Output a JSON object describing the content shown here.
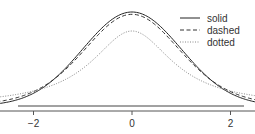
{
  "chart_data": {
    "type": "line",
    "title": "",
    "xlabel": "",
    "ylabel": "",
    "xlim": [
      -4.6,
      4.6
    ],
    "ylim": [
      0,
      0.4
    ],
    "grid": false,
    "legend_position": "top-right",
    "x_ticks": [
      -4,
      -2,
      0,
      2,
      4
    ],
    "x_tick_labels": [
      "−4",
      "−2",
      "0",
      "2",
      "4"
    ],
    "series": [
      {
        "name": "solid",
        "style": "solid",
        "distribution": "normal",
        "peak": 0.399,
        "color": "#222222"
      },
      {
        "name": "dashed",
        "style": "dashed",
        "distribution": "t",
        "df": 10,
        "peak": 0.389,
        "color": "#333333"
      },
      {
        "name": "dotted",
        "style": "dotted",
        "distribution": "t",
        "df": 1,
        "peak": 0.318,
        "color": "#888888"
      }
    ]
  }
}
